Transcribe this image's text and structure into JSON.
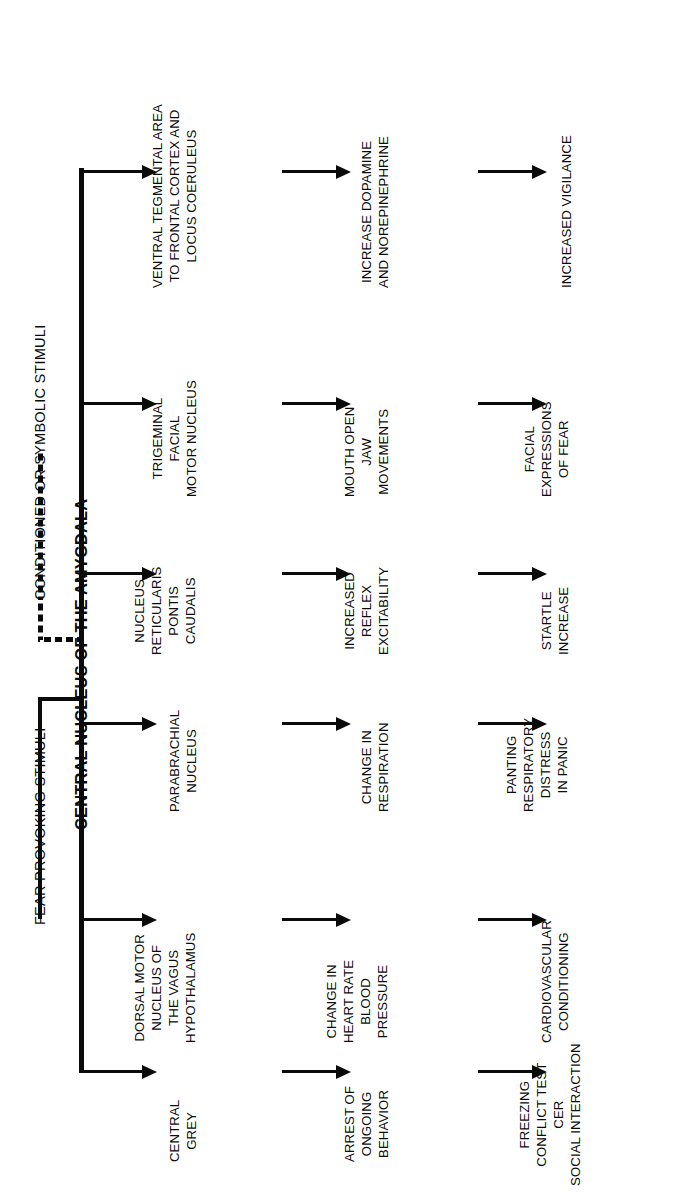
{
  "figure": {
    "orientation": "rotated-90-counterclockwise",
    "ink_color": "#0a0a0a",
    "background_color": "#ffffff"
  },
  "inputs": [
    {
      "id": "fear",
      "label": "FEAR PROVOKING STIMULI",
      "line_style": "solid"
    },
    {
      "id": "conditioned",
      "label": "CONDITIONED OR SYMBOLIC STIMULI",
      "line_style": "dashed"
    }
  ],
  "trunk": {
    "label": "CENTRAL NUCLEUS OF THE AMYGDALA",
    "branch_count": 6
  },
  "columns": [
    {
      "id": "target",
      "header": ""
    },
    {
      "id": "effect",
      "header": ""
    },
    {
      "id": "behavior",
      "header": ""
    }
  ],
  "pathways": [
    {
      "id": "central-grey",
      "target": [
        "CENTRAL",
        "GREY"
      ],
      "effect": [
        "ARREST OF",
        "ONGOING",
        "BEHAVIOR"
      ],
      "behavior": [
        "FREEZING",
        "CONFLICT TEST",
        "CER",
        "SOCIAL INTERACTION"
      ]
    },
    {
      "id": "dorsal-motor-vagus",
      "target": [
        "DORSAL MOTOR",
        "NUCLEUS OF",
        "THE VAGUS",
        "HYPOTHALAMUS"
      ],
      "effect": [
        "CHANGE IN",
        "HEART RATE",
        "BLOOD",
        "PRESSURE"
      ],
      "behavior": [
        "CARDIOVASCULAR",
        "CONDITIONING"
      ]
    },
    {
      "id": "parabrachial-nucleus",
      "target": [
        "PARABRACHIAL",
        "NUCLEUS"
      ],
      "effect": [
        "CHANGE IN",
        "RESPIRATION"
      ],
      "behavior": [
        "PANTING",
        "RESPIRATORY",
        "DISTRESS",
        "IN PANIC"
      ]
    },
    {
      "id": "nucleus-reticularis-pontis-caudalis",
      "target": [
        "NUCLEUS",
        "RETICULARIS",
        "PONTIS",
        "CAUDALIS"
      ],
      "effect": [
        "INCREASED",
        "REFLEX",
        "EXCITABILITY"
      ],
      "behavior": [
        "STARTLE",
        "INCREASE"
      ]
    },
    {
      "id": "trigeminal-facial-motor-nucleus",
      "target": [
        "TRIGEMINAL",
        "FACIAL",
        "MOTOR NUCLEUS"
      ],
      "effect": [
        "MOUTH OPEN",
        "JAW",
        "MOVEMENTS"
      ],
      "behavior": [
        "FACIAL",
        "EXPRESSIONS",
        "OF FEAR"
      ]
    },
    {
      "id": "ventral-tegmental-area",
      "target": [
        "VENTRAL TEGMENTAL AREA",
        "TO FRONTAL CORTEX AND",
        "LOCUS COERULEUS"
      ],
      "effect": [
        "INCREASE DOPAMINE",
        "AND NOREPINEPHRINE"
      ],
      "behavior": [
        "INCREASED VIGILANCE"
      ]
    }
  ]
}
